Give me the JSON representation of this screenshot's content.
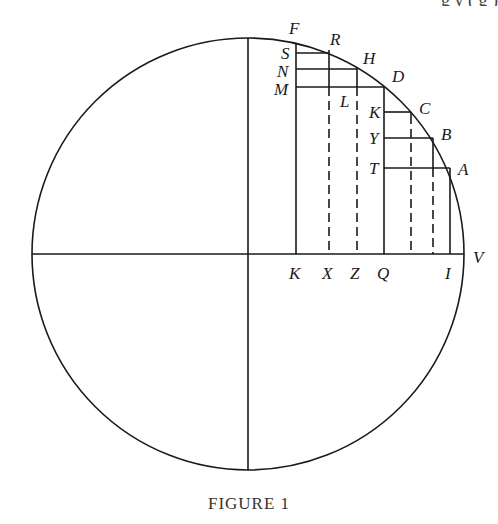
{
  "header_fragment": "g y ( g )",
  "figure": {
    "caption": "FIGURE 1",
    "circle": {
      "cx": 248,
      "cy": 254,
      "r": 216
    },
    "axes": {
      "horizontal": "diameter through center",
      "vertical": "diameter through center"
    },
    "points_on_arc": [
      {
        "label": "F",
        "x": 296,
        "y": 45
      },
      {
        "label": "R",
        "x": 329,
        "y": 50
      },
      {
        "label": "H",
        "x": 357,
        "y": 69
      },
      {
        "label": "D",
        "x": 384,
        "y": 87
      },
      {
        "label": "C",
        "x": 411,
        "y": 112
      },
      {
        "label": "B",
        "x": 433,
        "y": 138
      },
      {
        "label": "A",
        "x": 450,
        "y": 168
      }
    ],
    "left_labels": [
      {
        "label": "S",
        "y": 53
      },
      {
        "label": "N",
        "y": 69
      },
      {
        "label": "M",
        "y": 87
      },
      {
        "label": "K",
        "y": 112
      },
      {
        "label": "Y",
        "y": 138
      },
      {
        "label": "T",
        "y": 168
      }
    ],
    "interior_labels": [
      {
        "label": "L"
      }
    ],
    "bottom_labels": [
      "K",
      "X",
      "Z",
      "Q",
      "I",
      "V"
    ],
    "label_text": {
      "F": "F",
      "R": "R",
      "S": "S",
      "H": "H",
      "N": "N",
      "D": "D",
      "M": "M",
      "L": "L",
      "K_upper": "K",
      "C": "C",
      "Y": "Y",
      "B": "B",
      "T": "T",
      "A": "A",
      "V": "V",
      "K_lower": "K",
      "X": "X",
      "Z": "Z",
      "Q": "Q",
      "I": "I"
    }
  }
}
